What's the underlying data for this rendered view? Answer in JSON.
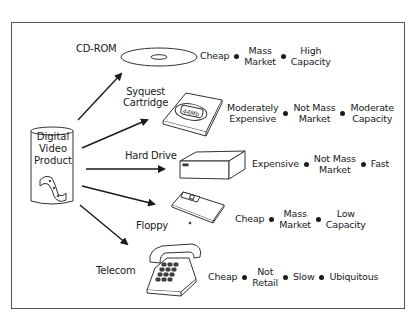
{
  "diagram": {
    "source": {
      "label_lines": [
        "Digital",
        "Video",
        "Product"
      ],
      "icon": "film-strip-icon"
    },
    "channels": [
      {
        "name": "CD-ROM",
        "icon": "cd-disc-icon",
        "attributes": [
          "Cheap",
          "Mass Market",
          "High Capacity"
        ]
      },
      {
        "name": "Syquest Cartridge",
        "icon": "cartridge-icon",
        "icon_text": "44Mb",
        "attributes": [
          "Moderately Expensive",
          "Not Mass Market",
          "Moderate Capacity"
        ]
      },
      {
        "name": "Hard Drive",
        "icon": "hard-drive-icon",
        "attributes": [
          "Expensive",
          "Not Mass Market",
          "Fast"
        ]
      },
      {
        "name": "Floppy",
        "icon": "floppy-disk-icon",
        "attributes": [
          "Cheap",
          "Mass Market",
          "Low Capacity"
        ]
      },
      {
        "name": "Telecom",
        "icon": "telephone-icon",
        "attributes": [
          "Cheap",
          "Not Retail",
          "Slow",
          "Ubiquitous"
        ]
      }
    ]
  },
  "labels": {
    "cdrom": "CD-ROM",
    "syquest_1": "Syquest",
    "syquest_2": "Cartridge",
    "harddrive": "Hard Drive",
    "floppy": "Floppy",
    "telecom": "Telecom",
    "src_1": "Digital",
    "src_2": "Video",
    "src_3": "Product",
    "cart_text": "44Mb",
    "cd_a1": "Cheap",
    "cd_a2a": "Mass",
    "cd_a2b": "Market",
    "cd_a3a": "High",
    "cd_a3b": "Capacity",
    "sq_a1a": "Moderately",
    "sq_a1b": "Expensive",
    "sq_a2a": "Not Mass",
    "sq_a2b": "Market",
    "sq_a3a": "Moderate",
    "sq_a3b": "Capacity",
    "hd_a1": "Expensive",
    "hd_a2a": "Not Mass",
    "hd_a2b": "Market",
    "hd_a3": "Fast",
    "fl_a1": "Cheap",
    "fl_a2a": "Mass",
    "fl_a2b": "Market",
    "fl_a3a": "Low",
    "fl_a3b": "Capacity",
    "tc_a1": "Cheap",
    "tc_a2a": "Not",
    "tc_a2b": "Retail",
    "tc_a3": "Slow",
    "tc_a4": "Ubiquitous"
  }
}
